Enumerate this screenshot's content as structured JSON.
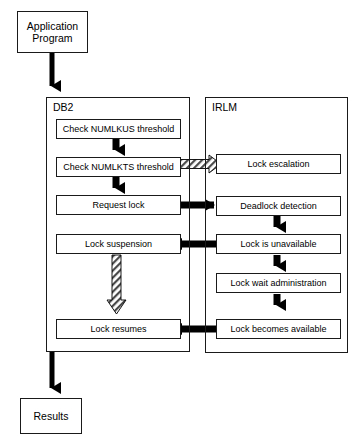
{
  "diagram": {
    "type": "flowchart",
    "colors": {
      "stroke": "#1a1a1a",
      "solid_arrow": "#000000",
      "hatched_arrow_fill": "#ffffff",
      "hatched_arrow_stroke": "#000000",
      "background": "#ffffff"
    }
  },
  "terminals": {
    "start": {
      "label_line1": "Application",
      "label_line2": "Program"
    },
    "end": {
      "label": "Results"
    }
  },
  "panels": {
    "db2": {
      "title": "DB2"
    },
    "irlm": {
      "title": "IRLM"
    }
  },
  "nodes": {
    "db2": [
      {
        "id": "check-numlkus",
        "label": "Check NUMLKUS threshold"
      },
      {
        "id": "check-numlkts",
        "label": "Check NUMLKTS threshold"
      },
      {
        "id": "request-lock",
        "label": "Request lock"
      },
      {
        "id": "lock-suspension",
        "label": "Lock suspension"
      },
      {
        "id": "lock-resumes",
        "label": "Lock resumes"
      }
    ],
    "irlm": [
      {
        "id": "lock-escalation",
        "label": "Lock escalation"
      },
      {
        "id": "deadlock-detection",
        "label": "Deadlock detection"
      },
      {
        "id": "lock-is-unavailable",
        "label": "Lock is unavailable"
      },
      {
        "id": "lock-wait-administration",
        "label": "Lock wait administration"
      },
      {
        "id": "lock-becomes-available",
        "label": "Lock becomes available"
      }
    ]
  },
  "edges": [
    {
      "from": "application-program",
      "to": "db2-panel",
      "style": "solid",
      "direction": "down"
    },
    {
      "from": "check-numlkus",
      "to": "check-numlkts",
      "style": "solid",
      "direction": "down"
    },
    {
      "from": "check-numlkts",
      "to": "lock-escalation",
      "style": "hatched",
      "direction": "right"
    },
    {
      "from": "check-numlkts",
      "to": "request-lock",
      "style": "solid",
      "direction": "down"
    },
    {
      "from": "request-lock",
      "to": "deadlock-detection",
      "style": "solid",
      "direction": "right"
    },
    {
      "from": "deadlock-detection",
      "to": "lock-is-unavailable",
      "style": "solid",
      "direction": "down"
    },
    {
      "from": "lock-is-unavailable",
      "to": "lock-suspension",
      "style": "solid",
      "direction": "left"
    },
    {
      "from": "lock-is-unavailable",
      "to": "lock-wait-administration",
      "style": "solid",
      "direction": "down"
    },
    {
      "from": "lock-suspension",
      "to": "lock-resumes",
      "style": "hatched",
      "direction": "down"
    },
    {
      "from": "lock-wait-administration",
      "to": "lock-becomes-available",
      "style": "solid",
      "direction": "down"
    },
    {
      "from": "lock-becomes-available",
      "to": "lock-resumes",
      "style": "solid",
      "direction": "left"
    },
    {
      "from": "db2-panel",
      "to": "results",
      "style": "solid",
      "direction": "down"
    }
  ]
}
